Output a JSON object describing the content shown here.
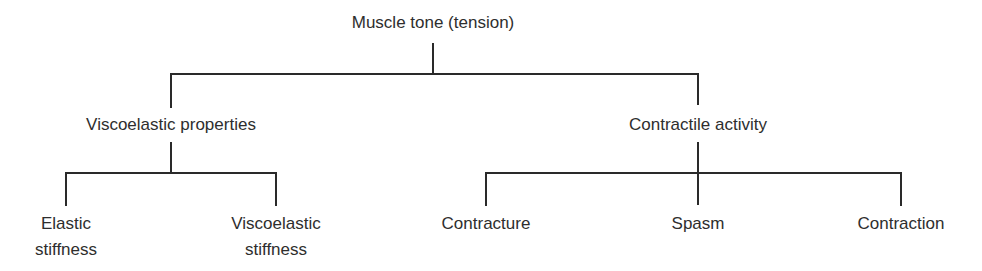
{
  "diagram": {
    "type": "hierarchy-tree",
    "root": {
      "label": "Muscle tone (tension)",
      "children": [
        {
          "label": "Viscoelastic properties",
          "children": [
            {
              "label_line1": "Elastic",
              "label_line2": "stiffness"
            },
            {
              "label_line1": "Viscoelastic",
              "label_line2": "stiffness"
            }
          ]
        },
        {
          "label": "Contractile activity",
          "children": [
            {
              "label": "Contracture"
            },
            {
              "label": "Spasm"
            },
            {
              "label": "Contraction"
            }
          ]
        }
      ]
    },
    "colors": {
      "line": "#2a2a2a",
      "text": "#2e2e2e",
      "background": "#ffffff"
    }
  }
}
